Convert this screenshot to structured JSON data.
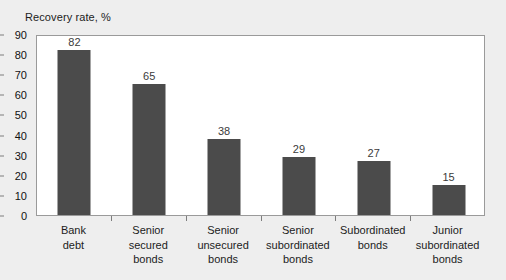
{
  "chart_data": {
    "type": "bar",
    "title": "Recovery rate, %",
    "xlabel": "",
    "ylabel": "",
    "ylim": [
      0,
      90
    ],
    "yticks": [
      0,
      10,
      20,
      30,
      40,
      50,
      60,
      70,
      80,
      90
    ],
    "grid": false,
    "legend": false,
    "bar_color": "#4b4b4b",
    "plot_background": "#ffffff",
    "figure_background": "#eeeeee",
    "axis_color": "#9a9a9a",
    "categories": [
      "Bank debt",
      "Senior secured bonds",
      "Senior unsecured bonds",
      "Senior subordinated bonds",
      "Subordinated bonds",
      "Junior subordinated bonds"
    ],
    "category_lines": [
      [
        "Bank",
        "debt"
      ],
      [
        "Senior",
        "secured",
        "bonds"
      ],
      [
        "Senior",
        "unsecured",
        "bonds"
      ],
      [
        "Senior",
        "subordinated",
        "bonds"
      ],
      [
        "Subordinated",
        "bonds"
      ],
      [
        "Junior",
        "subordinated",
        "bonds"
      ]
    ],
    "values": [
      82,
      65,
      38,
      29,
      27,
      15
    ],
    "data_labels": [
      "82",
      "65",
      "38",
      "29",
      "27",
      "15"
    ],
    "ytick_labels": [
      "0",
      "10",
      "20",
      "30",
      "40",
      "50",
      "60",
      "70",
      "80",
      "90"
    ]
  }
}
